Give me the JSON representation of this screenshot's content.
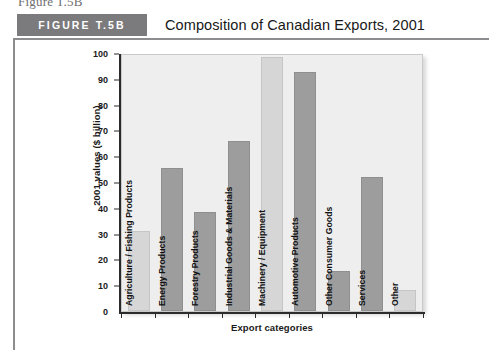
{
  "page": {
    "bleed_text": "Figure T.5B"
  },
  "figure": {
    "tag": "FIGURE T.5B",
    "title": "Composition of Canadian Exports, 2001"
  },
  "colors": {
    "tag_background": "#7b7b7d",
    "rule": "#8d8d8f",
    "plot_background": "#eeeeee",
    "bar_dark": "#9d9d9d",
    "bar_light": "#d6d6d6",
    "axis": "#2b2b2b"
  },
  "chart_data": {
    "type": "bar",
    "title": "Composition of Canadian Exports, 2001",
    "xlabel": "Export categories",
    "ylabel": "2001 values ($ billion)",
    "ylim": [
      0,
      100
    ],
    "ytick_labels": [
      "100",
      "90",
      "80",
      "70",
      "60",
      "50",
      "40",
      "30",
      "20",
      "10",
      "0"
    ],
    "ytick_values": [
      100,
      90,
      80,
      70,
      60,
      50,
      40,
      30,
      20,
      10,
      0
    ],
    "grid": false,
    "legend": null,
    "categories": [
      "Agriculture / Fishing Products",
      "Energy Products",
      "Forestry Products",
      "Industrial Goods & Materials",
      "Machinery / Equipment",
      "Automotive Products",
      "Other Consumer Goods",
      "Services",
      "Other"
    ],
    "values": [
      31,
      55.5,
      38.5,
      66,
      98.5,
      92.5,
      15.5,
      52,
      8
    ],
    "bar_shades": [
      "light",
      "dark",
      "dark",
      "dark",
      "light",
      "dark",
      "dark",
      "dark",
      "light"
    ]
  }
}
